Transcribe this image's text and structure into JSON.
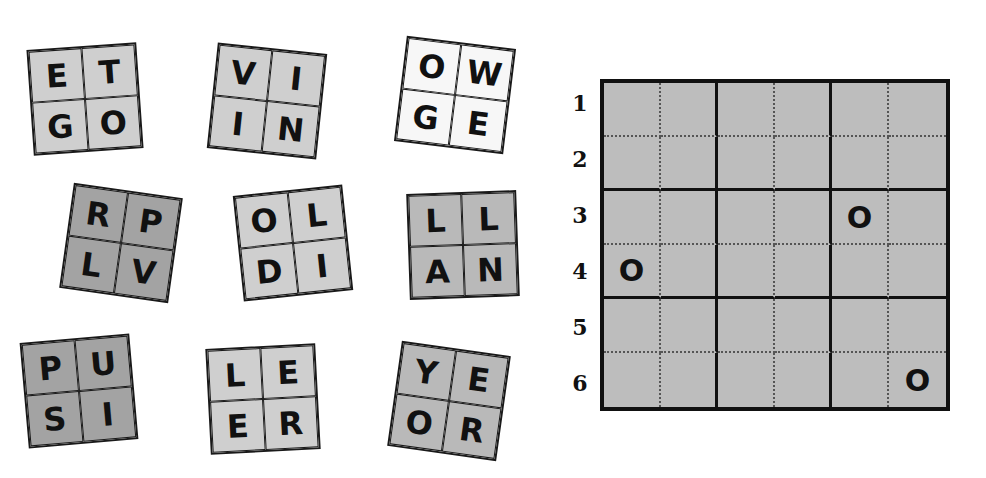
{
  "tiles": [
    {
      "letters": [
        "E",
        "T",
        "G",
        "O"
      ],
      "shade": "light"
    },
    {
      "letters": [
        "V",
        "I",
        "I",
        "N"
      ],
      "shade": "light"
    },
    {
      "letters": [
        "O",
        "W",
        "G",
        "E"
      ],
      "shade": "white"
    },
    {
      "letters": [
        "R",
        "P",
        "L",
        "V"
      ],
      "shade": "dark"
    },
    {
      "letters": [
        "O",
        "L",
        "D",
        "I"
      ],
      "shade": "light"
    },
    {
      "letters": [
        "L",
        "L",
        "A",
        "N"
      ],
      "shade": "mid"
    },
    {
      "letters": [
        "P",
        "U",
        "S",
        "I"
      ],
      "shade": "dark"
    },
    {
      "letters": [
        "L",
        "E",
        "E",
        "R"
      ],
      "shade": "light"
    },
    {
      "letters": [
        "Y",
        "E",
        "O",
        "R"
      ],
      "shade": "mid"
    }
  ],
  "board": {
    "row_labels": [
      "1",
      "2",
      "3",
      "4",
      "5",
      "6"
    ],
    "rows": [
      [
        "",
        "",
        "",
        "",
        "",
        ""
      ],
      [
        "",
        "",
        "",
        "",
        "",
        ""
      ],
      [
        "",
        "",
        "",
        "",
        "O",
        ""
      ],
      [
        "O",
        "",
        "",
        "",
        "",
        ""
      ],
      [
        "",
        "",
        "",
        "",
        "",
        ""
      ],
      [
        "",
        "",
        "",
        "",
        "",
        "O"
      ]
    ]
  }
}
